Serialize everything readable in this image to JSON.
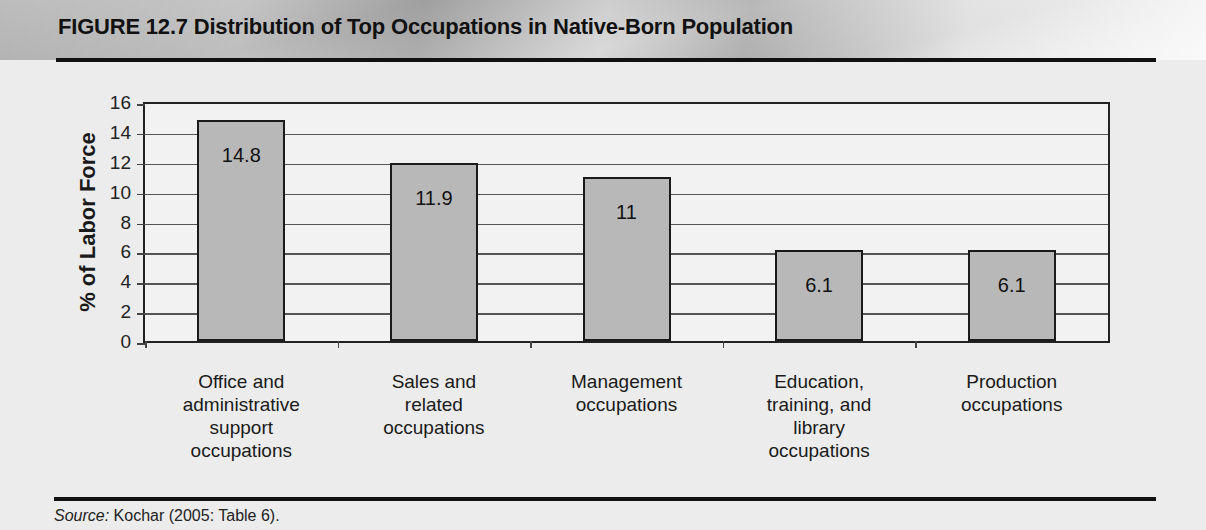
{
  "figure": {
    "title": "FIGURE 12.7 Distribution of Top Occupations in Native-Born Population",
    "source_prefix": "Source:",
    "source_text": " Kochar (2005: Table 6)."
  },
  "chart_data": {
    "type": "bar",
    "title": "Distribution of Top Occupations in Native-Born Population",
    "xlabel": "",
    "ylabel": "% of Labor Force",
    "ylim": [
      0,
      16
    ],
    "yticks": [
      "0",
      "2",
      "4",
      "6",
      "8",
      "10",
      "12",
      "14",
      "16"
    ],
    "grid": true,
    "legend": null,
    "categories": [
      "Office and administrative support occupations",
      "Sales and related occupations",
      "Management occupations",
      "Education, training, and library occupations",
      "Production occupations"
    ],
    "category_lines": [
      "Office and\nadministrative\nsupport\noccupations",
      "Sales and\nrelated\noccupations",
      "Management\noccupations",
      "Education,\ntraining, and\nlibrary\noccupations",
      "Production\noccupations"
    ],
    "values": [
      14.8,
      11.9,
      11,
      6.1,
      6.1
    ],
    "value_labels": [
      "14.8",
      "11.9",
      "11",
      "6.1",
      "6.1"
    ],
    "bar_color": "#b8b8b8"
  }
}
